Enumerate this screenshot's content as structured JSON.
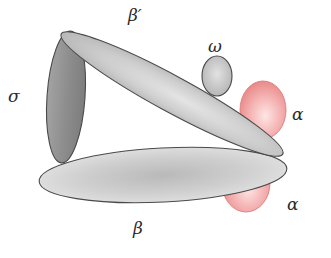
{
  "diagram": {
    "title": "",
    "subunits": [
      {
        "id": "beta_prime",
        "label": "β′",
        "color": "#d2d2d2"
      },
      {
        "id": "omega",
        "label": "ω",
        "color": "#c9c9c9"
      },
      {
        "id": "sigma",
        "label": "σ",
        "color": "#8f8f8f"
      },
      {
        "id": "alpha_upper",
        "label": "α",
        "color": "#f09a9a"
      },
      {
        "id": "alpha_lower",
        "label": "α",
        "color": "#f09a9a"
      },
      {
        "id": "beta",
        "label": "β",
        "color": "#d6d6d6"
      }
    ],
    "labels": {
      "beta_prime": "β′",
      "omega": "ω",
      "sigma": "σ",
      "alpha_upper": "α",
      "alpha_lower": "α",
      "beta": "β"
    },
    "colors": {
      "outline": "#4a4a4a",
      "gray_light": "#d4d4d4",
      "gray_mid": "#bdbdbd",
      "gray_dark": "#8c8c8c",
      "pink": "#f09a9a",
      "pink_highlight": "#fde4e4"
    }
  }
}
